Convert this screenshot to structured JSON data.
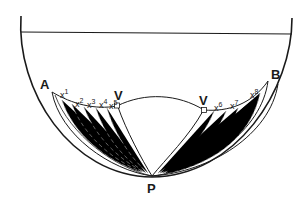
{
  "diagram": {
    "type": "geometric-construction",
    "labels": {
      "A": "A",
      "B": "B",
      "P": "P",
      "V_left": "V",
      "V_right": "V"
    },
    "points": [
      {
        "base": "x",
        "sup": "1"
      },
      {
        "base": "x",
        "sup": "2"
      },
      {
        "base": "x",
        "sup": "3"
      },
      {
        "base": "x",
        "sup": "4"
      },
      {
        "base": "x",
        "sup": "5"
      },
      {
        "base": "x",
        "sup": "6"
      },
      {
        "base": "x",
        "sup": "7"
      },
      {
        "base": "x",
        "sup": "8"
      }
    ],
    "colors": {
      "stroke": "#1a1a1a",
      "hatch": "#8a8a8a",
      "background": "#ffffff"
    }
  }
}
